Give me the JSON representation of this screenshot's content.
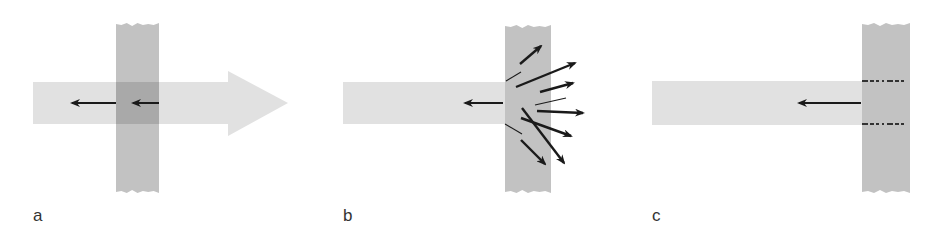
{
  "figure": {
    "colors": {
      "background": "#ffffff",
      "beam": "#e1e1e1",
      "barrier": "#c2c2c2",
      "overlap": "#a9a9a9",
      "arrow": "#1a1a1a",
      "label": "#333333"
    },
    "panels": [
      {
        "id": "a",
        "label": "a",
        "description": "Beam passes through barrier; small reflected arrows",
        "beam": {
          "x": 33,
          "y": 82,
          "width": 195,
          "height": 42,
          "head_tip_x": 288,
          "head_top": 71,
          "head_bottom": 136
        },
        "barrier": {
          "x": 116,
          "y": 23,
          "width": 43,
          "height": 170
        },
        "arrows": [
          {
            "x1": 116,
            "y1": 103,
            "x2": 72,
            "y2": 103,
            "weight": "normal"
          },
          {
            "x1": 159,
            "y1": 103,
            "x2": 133,
            "y2": 103,
            "weight": "normal"
          }
        ],
        "label_pos": {
          "x": 33,
          "y": 208
        }
      },
      {
        "id": "b",
        "label": "b",
        "description": "Beam stops at barrier; scattered arrows",
        "beam": {
          "x": 343,
          "y": 82,
          "width": 162,
          "height": 42
        },
        "barrier": {
          "x": 505,
          "y": 25,
          "width": 46,
          "height": 168
        },
        "arrows": [
          {
            "x1": 503,
            "y1": 103,
            "x2": 465,
            "y2": 103,
            "weight": "normal"
          },
          {
            "x1": 520,
            "y1": 64,
            "x2": 541,
            "y2": 46,
            "weight": "bold"
          },
          {
            "x1": 506,
            "y1": 81,
            "x2": 521,
            "y2": 72,
            "weight": "thin"
          },
          {
            "x1": 516,
            "y1": 87,
            "x2": 575,
            "y2": 63,
            "weight": "bold"
          },
          {
            "x1": 540,
            "y1": 92,
            "x2": 573,
            "y2": 83,
            "weight": "bold"
          },
          {
            "x1": 535,
            "y1": 105,
            "x2": 566,
            "y2": 98,
            "weight": "thin"
          },
          {
            "x1": 537,
            "y1": 111,
            "x2": 583,
            "y2": 113,
            "weight": "bold"
          },
          {
            "x1": 521,
            "y1": 118,
            "x2": 571,
            "y2": 136,
            "weight": "bold"
          },
          {
            "x1": 522,
            "y1": 108,
            "x2": 564,
            "y2": 163,
            "weight": "bold"
          },
          {
            "x1": 505,
            "y1": 124,
            "x2": 522,
            "y2": 134,
            "weight": "thin"
          },
          {
            "x1": 521,
            "y1": 140,
            "x2": 545,
            "y2": 164,
            "weight": "bold"
          }
        ],
        "label_pos": {
          "x": 343,
          "y": 208
        }
      },
      {
        "id": "c",
        "label": "c",
        "description": "Beam stops at barrier surface; dashed boundaries",
        "beam": {
          "x": 652,
          "y": 81,
          "width": 210,
          "height": 44
        },
        "barrier": {
          "x": 862,
          "y": 23,
          "width": 48,
          "height": 170
        },
        "arrows": [
          {
            "x1": 861,
            "y1": 103,
            "x2": 799,
            "y2": 103,
            "weight": "normal"
          }
        ],
        "dashes": [
          {
            "x1": 862,
            "y1": 81,
            "x2": 906,
            "y2": 81
          },
          {
            "x1": 862,
            "y1": 124,
            "x2": 906,
            "y2": 124
          }
        ],
        "label_pos": {
          "x": 652,
          "y": 208
        }
      }
    ]
  }
}
